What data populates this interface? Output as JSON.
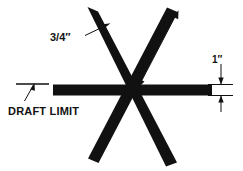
{
  "figure": {
    "kind": "engineering-dimension-drawing",
    "background_color": "#ffffff",
    "ink_color": "#111111"
  },
  "annotations": {
    "bar_width": {
      "text": "3/4″",
      "name": "bar-width-dimension",
      "points_to": "upper-left-arm"
    },
    "arm_length": {
      "text": "9″",
      "name": "arm-length-dimension",
      "points_to": "upper-right-arm"
    },
    "bar_thickness": {
      "text": "1″",
      "name": "bar-thickness-dimension",
      "points_to": "horizontal-bar-right-end"
    },
    "draft_limit": {
      "text": "DRAFT LIMIT",
      "name": "draft-limit-label",
      "points_to": "draft-limit-line"
    }
  },
  "arms": [
    {
      "id": "arm-upper-left",
      "label": "upper left arm"
    },
    {
      "id": "arm-upper-right",
      "label": "upper right arm"
    },
    {
      "id": "arm-right",
      "label": "right arm"
    },
    {
      "id": "arm-lower-right",
      "label": "lower right arm"
    },
    {
      "id": "arm-lower-left",
      "label": "lower left arm"
    },
    {
      "id": "arm-left",
      "label": "left arm"
    }
  ]
}
